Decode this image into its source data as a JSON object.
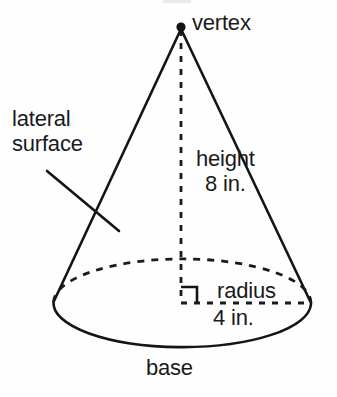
{
  "figure": {
    "shape": "cone",
    "stroke_color": "#141414",
    "background_color": "#fefefe",
    "text_color": "#1a1a1a"
  },
  "labels": {
    "vertex": "vertex",
    "lateral_surface_line1": "lateral",
    "lateral_surface_line2": "surface",
    "height_line1": "height",
    "height_line2": "8 in.",
    "radius": "radius",
    "radius_value": "4 in.",
    "base": "base"
  },
  "measurements": {
    "height_value": "8",
    "height_unit": "in.",
    "radius_value": "4",
    "radius_unit": "in."
  },
  "geometry": {
    "apex_x": 181,
    "apex_y": 27,
    "center_x": 181,
    "center_y": 304,
    "radius_x": 130,
    "radius_y": 43,
    "base_left_x": 53,
    "base_right_x": 312,
    "base_bottom_y": 347,
    "right_angle_size": 16
  }
}
